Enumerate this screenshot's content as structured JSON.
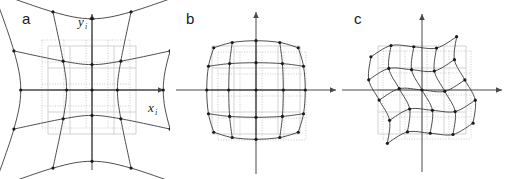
{
  "figure": {
    "background_color": "#ffffff",
    "width": 508,
    "height": 179,
    "panel_count": 3
  },
  "style": {
    "distorted_grid_color": "#3a3a3a",
    "reference_grid_color": "#c8c8c8",
    "reference_grid_dotted_color": "#bdbdbd",
    "axis_color": "#4a4a4a",
    "node_color": "#1a1a1a",
    "label_color": "#1a1a1a"
  },
  "panels": [
    {
      "id": "a",
      "label": "a",
      "distortion_type": "pincushion",
      "caption": "pincushion distortion",
      "axes": {
        "x_label": "x",
        "x_label_subscript": "i",
        "y_label": "y",
        "y_label_subscript": "i",
        "show_x_axis": true,
        "show_y_axis": true,
        "arrowheads": true
      },
      "grid": {
        "rows": 5,
        "cols": 5,
        "node_count": 25,
        "reference_square_visible": true
      }
    },
    {
      "id": "b",
      "label": "b",
      "distortion_type": "barrel",
      "caption": "barrel distortion",
      "axes": {
        "x_label": "",
        "x_label_subscript": "",
        "y_label": "",
        "y_label_subscript": "",
        "show_x_axis": true,
        "show_y_axis": true,
        "arrowheads": true
      },
      "grid": {
        "rows": 5,
        "cols": 5,
        "node_count": 25,
        "reference_square_visible": true
      }
    },
    {
      "id": "c",
      "label": "c",
      "distortion_type": "rotated-wavy",
      "caption": "rotational and wave distortion",
      "axes": {
        "x_label": "",
        "x_label_subscript": "",
        "y_label": "",
        "y_label_subscript": "",
        "show_x_axis": true,
        "show_y_axis": true,
        "arrowheads": true
      },
      "grid": {
        "rows": 5,
        "cols": 5,
        "node_count": 25,
        "reference_square_visible": true,
        "rotation_degrees": -12
      }
    }
  ]
}
